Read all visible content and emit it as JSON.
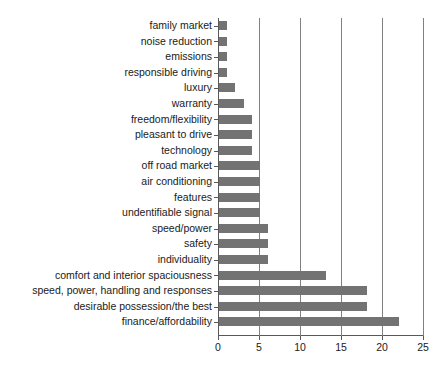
{
  "chart_data": {
    "type": "bar",
    "orientation": "horizontal",
    "title": "",
    "subtitle": "",
    "xlabel": "",
    "ylabel": "",
    "xlim": [
      0,
      25
    ],
    "xticks": [
      0,
      5,
      10,
      15,
      20,
      25
    ],
    "grid": "vertical gridlines at each x tick",
    "legend": "none",
    "bar_color": "#737373",
    "axis_color": "#58585a",
    "gridline_color": "#808080",
    "background_color": "#ffffff",
    "categories": [
      "family market",
      "noise reduction",
      "emissions",
      "responsible driving",
      "luxury",
      "warranty",
      "freedom/flexibility",
      "pleasant to drive",
      "technology",
      "off road market",
      "air conditioning",
      "features",
      "undentifiable signal",
      "speed/power",
      "safety",
      "individuality",
      "comfort and interior spaciousness",
      "speed, power, handling and responses",
      "desirable possession/the best",
      "finance/affordability"
    ],
    "values": [
      1,
      1,
      1,
      1,
      2,
      3,
      4,
      4,
      4,
      5,
      5,
      5,
      5,
      6,
      6,
      6,
      13,
      18,
      18,
      22
    ]
  }
}
